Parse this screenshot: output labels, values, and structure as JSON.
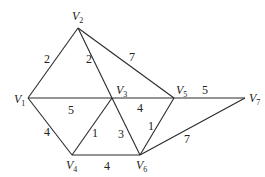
{
  "diagram": {
    "type": "weighted-undirected-graph",
    "nodes": [
      {
        "id": "V1",
        "letter": "V",
        "sub": "1",
        "x": 28,
        "y": 98,
        "lx": 14,
        "ly": 103
      },
      {
        "id": "V2",
        "letter": "V",
        "sub": "2",
        "x": 78,
        "y": 28,
        "lx": 72,
        "ly": 20
      },
      {
        "id": "V3",
        "letter": "V",
        "sub": "3",
        "x": 112,
        "y": 98,
        "lx": 116,
        "ly": 94
      },
      {
        "id": "V4",
        "letter": "V",
        "sub": "4",
        "x": 72,
        "y": 155,
        "lx": 66,
        "ly": 169
      },
      {
        "id": "V5",
        "letter": "V",
        "sub": "5",
        "x": 174,
        "y": 98,
        "lx": 176,
        "ly": 94
      },
      {
        "id": "V6",
        "letter": "V",
        "sub": "6",
        "x": 140,
        "y": 155,
        "lx": 136,
        "ly": 169
      },
      {
        "id": "V7",
        "letter": "V",
        "sub": "7",
        "x": 245,
        "y": 98,
        "lx": 249,
        "ly": 102
      }
    ],
    "edges": [
      {
        "from": "V1",
        "to": "V2",
        "weight": "2",
        "lx": 44,
        "ly": 63
      },
      {
        "from": "V2",
        "to": "V3",
        "weight": "2",
        "lx": 86,
        "ly": 63
      },
      {
        "from": "V2",
        "to": "V5",
        "weight": "7",
        "lx": 129,
        "ly": 61
      },
      {
        "from": "V1",
        "to": "V3",
        "weight": "5",
        "lx": 68,
        "ly": 114
      },
      {
        "from": "V1",
        "to": "V4",
        "weight": "4",
        "lx": 44,
        "ly": 136
      },
      {
        "from": "V3",
        "to": "V4",
        "weight": "1",
        "lx": 92,
        "ly": 137
      },
      {
        "from": "V3",
        "to": "V6",
        "weight": "3",
        "lx": 118,
        "ly": 138
      },
      {
        "from": "V3",
        "to": "V5",
        "weight": "4",
        "lx": 137,
        "ly": 112
      },
      {
        "from": "V5",
        "to": "V6",
        "weight": "1",
        "lx": 148,
        "ly": 130
      },
      {
        "from": "V5",
        "to": "V7",
        "weight": "5",
        "lx": 202,
        "ly": 94
      },
      {
        "from": "V6",
        "to": "V7",
        "weight": "7",
        "lx": 184,
        "ly": 143
      },
      {
        "from": "V4",
        "to": "V6",
        "weight": "4",
        "lx": 104,
        "ly": 170
      }
    ]
  }
}
